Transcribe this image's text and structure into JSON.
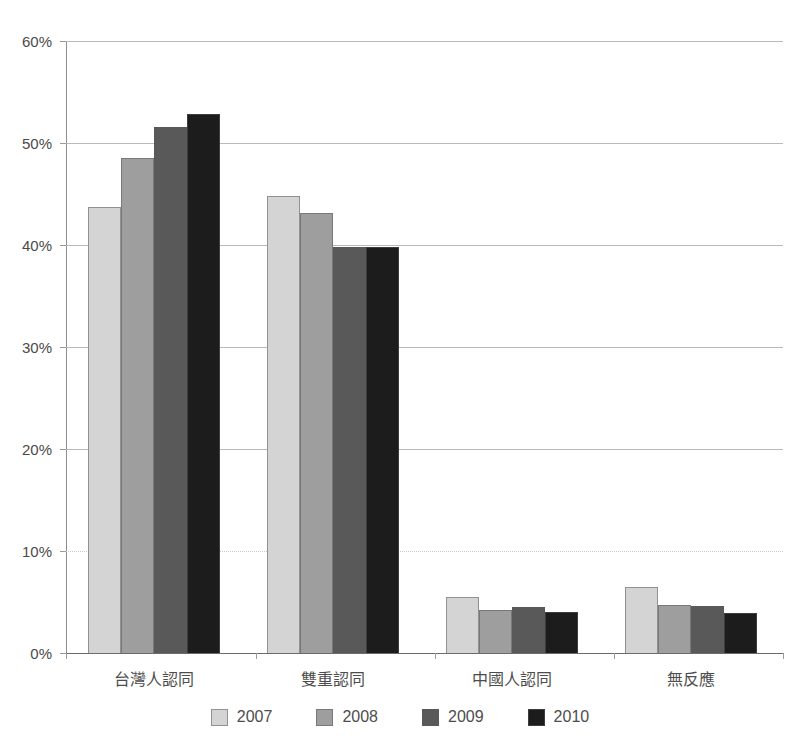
{
  "page": {
    "top_clipped_text": "",
    "background": "#ffffff"
  },
  "chart_data": {
    "type": "bar",
    "title": "",
    "subtitle": "",
    "xlabel": "",
    "ylabel": "",
    "categories": [
      "台灣人認同",
      "雙重認同",
      "中國人認同",
      "無反應"
    ],
    "series": [
      {
        "name": "2007",
        "color": "#d4d4d4",
        "values": [
          43.7,
          44.8,
          5.5,
          6.5
        ]
      },
      {
        "name": "2008",
        "color": "#9e9e9e",
        "values": [
          48.5,
          43.1,
          4.2,
          4.7
        ]
      },
      {
        "name": "2009",
        "color": "#595959",
        "values": [
          51.6,
          39.8,
          4.5,
          4.6
        ]
      },
      {
        "name": "2010",
        "color": "#1c1c1c",
        "values": [
          52.8,
          39.8,
          4.0,
          3.9
        ]
      }
    ],
    "ylim": [
      0,
      60
    ],
    "yticks": [
      0,
      10,
      20,
      30,
      40,
      50,
      60
    ],
    "ytick_labels": [
      "0%",
      "10%",
      "20%",
      "30%",
      "40%",
      "50%",
      "60%"
    ],
    "grid": true,
    "legend_position": "bottom",
    "value_suffix": "%"
  }
}
